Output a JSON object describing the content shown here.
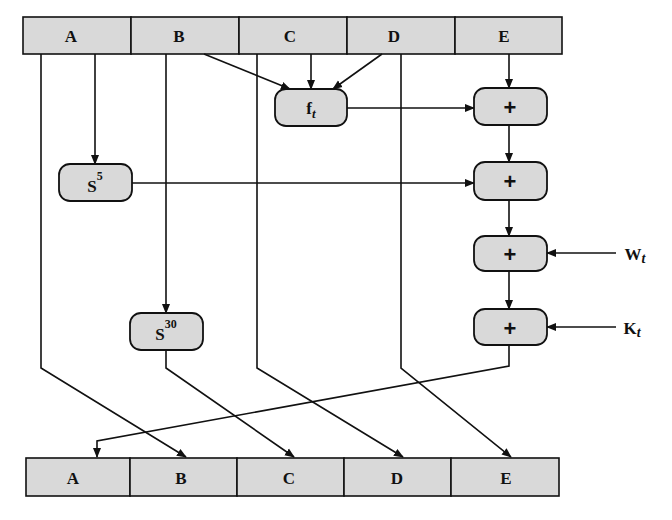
{
  "diagram": {
    "title": "",
    "colors": {
      "box_fill": "#d9d9d9",
      "stroke": "#111111",
      "background": "#ffffff"
    },
    "top_register": {
      "cells": [
        "A",
        "B",
        "C",
        "D",
        "E"
      ]
    },
    "bottom_register": {
      "cells": [
        "A",
        "B",
        "C",
        "D",
        "E"
      ]
    },
    "nodes": {
      "ft": {
        "label": "f",
        "sub": "t"
      },
      "s5": {
        "label": "S",
        "sup": "5"
      },
      "s30": {
        "label": "S",
        "sup": "30"
      },
      "add1": {
        "label": "+"
      },
      "add2": {
        "label": "+"
      },
      "add3": {
        "label": "+"
      },
      "add4": {
        "label": "+"
      }
    },
    "inputs": {
      "wt": {
        "label": "W",
        "sub": "t"
      },
      "kt": {
        "label": "K",
        "sub": "t"
      }
    },
    "edges": [
      {
        "from": "B",
        "to": "ft"
      },
      {
        "from": "C",
        "to": "ft"
      },
      {
        "from": "D",
        "to": "ft"
      },
      {
        "from": "E",
        "to": "add1"
      },
      {
        "from": "ft",
        "to": "add1"
      },
      {
        "from": "A",
        "to": "s5"
      },
      {
        "from": "s5",
        "to": "add2"
      },
      {
        "from": "add1",
        "to": "add2"
      },
      {
        "from": "add2",
        "to": "add3"
      },
      {
        "from": "wt",
        "to": "add3"
      },
      {
        "from": "add3",
        "to": "add4"
      },
      {
        "from": "kt",
        "to": "add4"
      },
      {
        "from": "add4",
        "to": "A_out"
      },
      {
        "from": "A",
        "to": "B_out"
      },
      {
        "from": "B",
        "to": "s30"
      },
      {
        "from": "s30",
        "to": "C_out"
      },
      {
        "from": "C",
        "to": "D_out"
      },
      {
        "from": "D",
        "to": "E_out"
      }
    ]
  }
}
